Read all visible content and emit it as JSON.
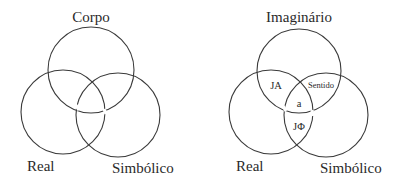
{
  "diagrams": [
    {
      "name": "left-borromean",
      "labels": {
        "top": "Corpo",
        "left": "Real",
        "right": "Simbólico"
      }
    },
    {
      "name": "right-borromean",
      "labels": {
        "top": "Imaginário",
        "left": "Real",
        "right": "Simbólico"
      },
      "regions": {
        "real_imaginary": "JA",
        "imaginary_symbolic": "Sentido",
        "center": "a",
        "real_symbolic": "JΦ"
      }
    }
  ],
  "colors": {
    "stroke": "#3a3a3a",
    "text": "#2a2a2a",
    "background": "#ffffff"
  }
}
